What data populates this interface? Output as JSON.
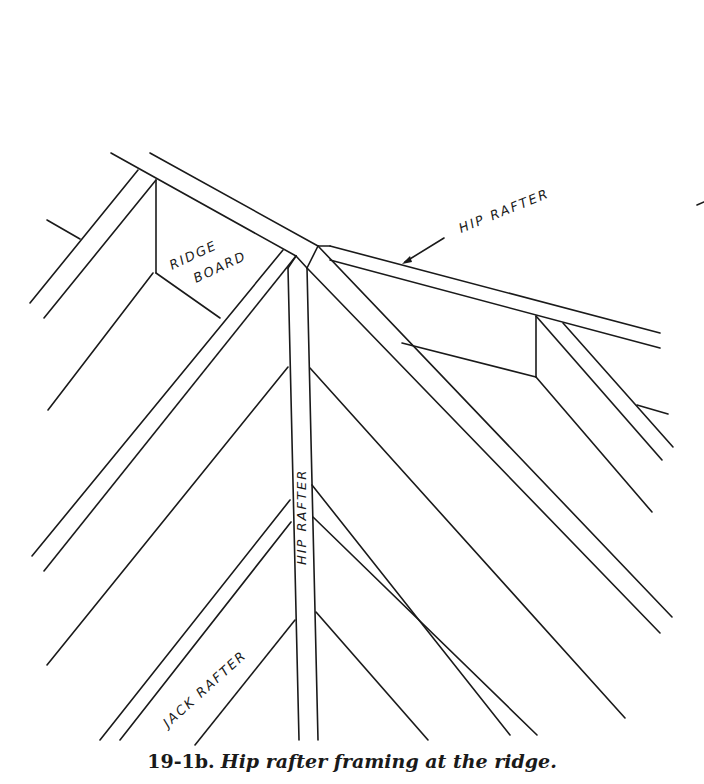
{
  "figure": {
    "number": "19-1b.",
    "caption": "Hip rafter framing at the ridge."
  },
  "labels": {
    "ridge_board_line1": "RIDGE",
    "ridge_board_line2": "BOARD",
    "hip_rafter_top": "HIP RAFTER",
    "hip_rafter_vertical": "HIP RAFTER",
    "jack_rafter": "JACK RAFTER"
  },
  "colors": {
    "ink": "#1a1a1a",
    "paper": "#ffffff"
  }
}
